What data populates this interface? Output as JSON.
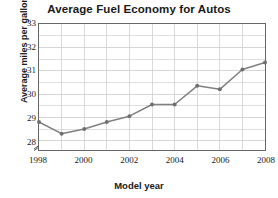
{
  "chart_data": {
    "type": "line",
    "title": "Average Fuel Economy for Autos",
    "xlabel": "Model year",
    "ylabel": "Average miles per gallon",
    "x": [
      1998,
      1999,
      2000,
      2001,
      2002,
      2003,
      2004,
      2005,
      2006,
      2007,
      2008
    ],
    "values": [
      28.8,
      28.3,
      28.5,
      28.8,
      29.05,
      29.55,
      29.55,
      30.35,
      30.2,
      31.05,
      31.35
    ],
    "series": [
      {
        "name": "Average miles per gallon",
        "values": [
          28.8,
          28.3,
          28.5,
          28.8,
          29.05,
          29.55,
          29.55,
          30.35,
          30.2,
          31.05,
          31.35
        ]
      }
    ],
    "xlim": [
      1998,
      2008
    ],
    "ylim": [
      27.6,
      33
    ],
    "ytick_labels": [
      "28",
      "29",
      "30",
      "31",
      "32",
      "33"
    ],
    "ytick_values": [
      28,
      29,
      30,
      31,
      32,
      33
    ],
    "xtick_labels": [
      "1998",
      "2000",
      "2002",
      "2004",
      "2006",
      "2008"
    ],
    "xtick_values": [
      1998,
      2000,
      2002,
      2004,
      2006,
      2008
    ],
    "minor_y_step": 0.5,
    "minor_x_step": 1,
    "grid": true,
    "legend": "none",
    "y_axis_break": true,
    "line_color": "#808080",
    "marker_color": "#707070",
    "grid_color": "#d0d0d0",
    "axis_color": "#666666",
    "text_color": "#1a1a1a"
  }
}
